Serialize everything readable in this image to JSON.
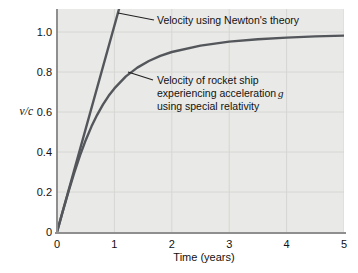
{
  "figure": {
    "ylabel": "v/c",
    "xlabel": "Time (years)",
    "annotations": {
      "newton": "Velocity using Newton's theory",
      "relativity_line1": "Velocity of rocket ship",
      "relativity_line2": "experiencing acceleration",
      "relativity_line2_var": "g",
      "relativity_line3": "using special relativity"
    },
    "colors": {
      "plot_bg": "#e9e9e7",
      "grid": "#d6d6d3",
      "axis": "#8f8f8f",
      "curve": "#53565a",
      "leader": "#222222"
    }
  },
  "chart_data": {
    "type": "line",
    "title": "",
    "xlabel": "Time (years)",
    "ylabel": "v/c",
    "xlim": [
      0,
      5
    ],
    "ylim": [
      0,
      1.115
    ],
    "xticks": [
      0,
      1,
      2,
      3,
      4,
      5
    ],
    "yticks": [
      0,
      0.2,
      0.4,
      0.6,
      0.8,
      1.0
    ],
    "grid": true,
    "legend_position": "none",
    "series": [
      {
        "name": "Velocity using Newton's theory",
        "x": [
          0,
          1.081
        ],
        "y": [
          0,
          1.115
        ]
      },
      {
        "name": "Velocity of rocket ship experiencing acceleration g using special relativity",
        "x": [
          0,
          0.1,
          0.2,
          0.3,
          0.4,
          0.5,
          0.6,
          0.7,
          0.8,
          0.9,
          1.0,
          1.2,
          1.4,
          1.6,
          1.8,
          2.0,
          2.5,
          3.0,
          3.5,
          4.0,
          4.5,
          5.0
        ],
        "y": [
          0,
          0.103,
          0.202,
          0.296,
          0.382,
          0.459,
          0.527,
          0.586,
          0.637,
          0.681,
          0.718,
          0.778,
          0.822,
          0.855,
          0.881,
          0.9,
          0.932,
          0.952,
          0.964,
          0.972,
          0.978,
          0.982
        ]
      }
    ]
  }
}
